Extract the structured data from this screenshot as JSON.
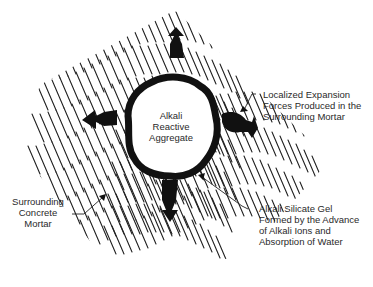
{
  "diagram": {
    "colors": {
      "ink": "#111111",
      "text": "#2a2a2a",
      "background": "#ffffff"
    },
    "labels": {
      "aggregate": {
        "lines": [
          "Alkali",
          "Reactive",
          "Aggregate"
        ]
      },
      "expansion": {
        "lines": [
          "Localized Expansion",
          "Forces Produced in the",
          "Surrounding Mortar"
        ]
      },
      "mortar": {
        "lines": [
          "Surrounding",
          "Concrete",
          "Mortar"
        ]
      },
      "gel": {
        "lines": [
          "Alkali Silicate Gel",
          "Formed by the Advance",
          "of Alkali Ions and",
          "Absorption of Water"
        ]
      }
    },
    "arrows": [
      "up",
      "left",
      "right",
      "down"
    ]
  }
}
